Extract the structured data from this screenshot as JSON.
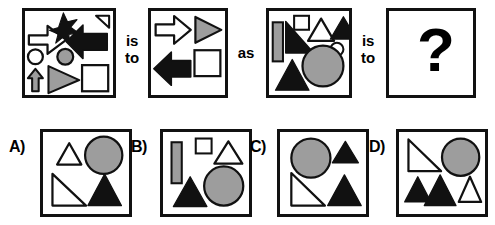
{
  "puzzle": {
    "type": "visual-analogy",
    "connectors": {
      "first_is": "is",
      "first_to": "to",
      "as": "as",
      "second_is": "is",
      "second_to": "to"
    },
    "question_mark": "?"
  },
  "colors": {
    "black": "#111111",
    "gray": "#9d9d9d",
    "white": "#ffffff",
    "outline": "#111111",
    "background": "#ffffff"
  },
  "stimulus_panels": [
    {
      "id": "panel-1",
      "name": "analogy-term-a",
      "shape_count": 9,
      "shapes": [
        {
          "shape": "arrow-right",
          "fill": "white"
        },
        {
          "shape": "star",
          "fill": "black"
        },
        {
          "shape": "triangle-small",
          "fill": "white"
        },
        {
          "shape": "arrow-left",
          "fill": "black"
        },
        {
          "shape": "circle-small",
          "fill": "white"
        },
        {
          "shape": "circle-small",
          "fill": "gray"
        },
        {
          "shape": "arrow-up",
          "fill": "gray"
        },
        {
          "shape": "triangle-right",
          "fill": "gray"
        },
        {
          "shape": "square",
          "fill": "white"
        }
      ]
    },
    {
      "id": "panel-2",
      "name": "analogy-term-b",
      "shape_count": 4,
      "shapes": [
        {
          "shape": "arrow-right",
          "fill": "white"
        },
        {
          "shape": "triangle-right",
          "fill": "gray"
        },
        {
          "shape": "arrow-left",
          "fill": "black"
        },
        {
          "shape": "square",
          "fill": "white"
        }
      ]
    },
    {
      "id": "panel-3",
      "name": "analogy-term-c",
      "shape_count": 8,
      "shapes": [
        {
          "shape": "bar-vertical",
          "fill": "gray"
        },
        {
          "shape": "triangle-right-down",
          "fill": "black"
        },
        {
          "shape": "square-small",
          "fill": "white"
        },
        {
          "shape": "triangle-up",
          "fill": "white"
        },
        {
          "shape": "triangle-up",
          "fill": "black"
        },
        {
          "shape": "circle-small",
          "fill": "white"
        },
        {
          "shape": "circle-large",
          "fill": "gray"
        },
        {
          "shape": "triangle-up",
          "fill": "black"
        }
      ]
    },
    {
      "id": "panel-4",
      "name": "analogy-answer-slot",
      "shape_count": 0,
      "shapes": []
    }
  ],
  "options": [
    {
      "id": "option-a",
      "label": "A)",
      "shape_count": 4,
      "shapes": [
        {
          "shape": "triangle-up",
          "fill": "white"
        },
        {
          "shape": "circle-large",
          "fill": "gray"
        },
        {
          "shape": "triangle-right-down",
          "fill": "white"
        },
        {
          "shape": "triangle-up",
          "fill": "black"
        }
      ]
    },
    {
      "id": "option-b",
      "label": "B)",
      "shape_count": 5,
      "shapes": [
        {
          "shape": "bar-vertical",
          "fill": "gray"
        },
        {
          "shape": "square-small",
          "fill": "white"
        },
        {
          "shape": "triangle-up",
          "fill": "white"
        },
        {
          "shape": "circle-large",
          "fill": "gray"
        },
        {
          "shape": "triangle-up",
          "fill": "black"
        }
      ]
    },
    {
      "id": "option-c",
      "label": "C)",
      "shape_count": 4,
      "shapes": [
        {
          "shape": "circle-large",
          "fill": "gray"
        },
        {
          "shape": "triangle-up",
          "fill": "black"
        },
        {
          "shape": "triangle-right-down",
          "fill": "white"
        },
        {
          "shape": "triangle-up",
          "fill": "black"
        }
      ]
    },
    {
      "id": "option-d",
      "label": "D)",
      "shape_count": 5,
      "shapes": [
        {
          "shape": "triangle-right-down",
          "fill": "white"
        },
        {
          "shape": "circle-large",
          "fill": "gray"
        },
        {
          "shape": "triangle-up",
          "fill": "black"
        },
        {
          "shape": "triangle-up",
          "fill": "black"
        },
        {
          "shape": "triangle-up",
          "fill": "white"
        }
      ]
    }
  ]
}
